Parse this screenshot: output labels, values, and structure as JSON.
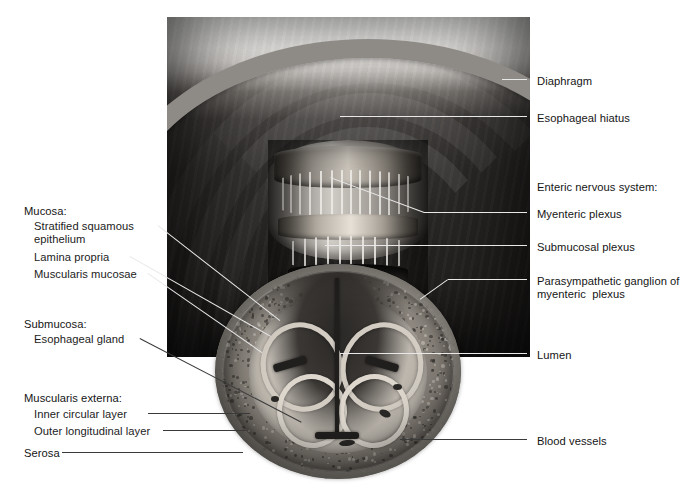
{
  "figure": {
    "background_color": "#ffffff",
    "plate_color": "#2d2b29"
  },
  "labels_left": [
    {
      "id": "mucosa-group",
      "text": "Mucosa:",
      "x": 24,
      "y": 205,
      "indent": false,
      "leader": false
    },
    {
      "id": "stratified-squamous",
      "text": "Stratified squamous",
      "x": 34,
      "y": 220,
      "indent": true,
      "leader": true
    },
    {
      "id": "epithelium",
      "text": "epithelium",
      "x": 34,
      "y": 233,
      "indent": true,
      "leader": false
    },
    {
      "id": "lamina-propria",
      "text": "Lamina propria",
      "x": 34,
      "y": 251,
      "indent": true,
      "leader": true
    },
    {
      "id": "muscularis-mucosae",
      "text": "Muscularis mucosae",
      "x": 34,
      "y": 268,
      "indent": true,
      "leader": true
    },
    {
      "id": "submucosa-group",
      "text": "Submucosa:",
      "x": 24,
      "y": 318,
      "indent": false,
      "leader": false
    },
    {
      "id": "esophageal-gland",
      "text": "Esophageal gland",
      "x": 34,
      "y": 333,
      "indent": true,
      "leader": true
    },
    {
      "id": "muscularis-externa-group",
      "text": "Muscularis externa:",
      "x": 24,
      "y": 392,
      "indent": false,
      "leader": false
    },
    {
      "id": "inner-circular-layer",
      "text": "Inner circular layer",
      "x": 34,
      "y": 408,
      "indent": true,
      "leader": true
    },
    {
      "id": "outer-longitudinal-layer",
      "text": "Outer longitudinal layer",
      "x": 34,
      "y": 425,
      "indent": true,
      "leader": true
    },
    {
      "id": "serosa",
      "text": "Serosa",
      "x": 24,
      "y": 447,
      "indent": false,
      "leader": true
    }
  ],
  "labels_right": [
    {
      "id": "diaphragm",
      "text": "Diaphragm",
      "x": 537,
      "y": 75,
      "leader": true
    },
    {
      "id": "esophageal-hiatus",
      "text": "Esophageal hiatus",
      "x": 537,
      "y": 112,
      "leader": true
    },
    {
      "id": "enteric-nervous-system-group",
      "text": "Enteric nervous system:",
      "x": 537,
      "y": 181,
      "leader": false
    },
    {
      "id": "myenteric-plexus",
      "text": "Myenteric plexus",
      "x": 537,
      "y": 208,
      "leader": true
    },
    {
      "id": "submucosal-plexus",
      "text": "Submucosal plexus",
      "x": 537,
      "y": 241,
      "leader": true
    },
    {
      "id": "parasympathetic-ganglion",
      "text": "Parasympathetic ganglion of",
      "x": 537,
      "y": 275,
      "leader": true
    },
    {
      "id": "parasympathetic-ganglion-line2",
      "text": "myenteric  plexus",
      "x": 537,
      "y": 288,
      "leader": false
    },
    {
      "id": "lumen",
      "text": "Lumen",
      "x": 537,
      "y": 349,
      "leader": true
    },
    {
      "id": "blood-vessels",
      "text": "Blood vessels",
      "x": 537,
      "y": 435,
      "leader": true
    }
  ],
  "leaders_left": [
    {
      "id": "leader-stratified-squamous",
      "x1": 158,
      "y1": 225,
      "x2": 280,
      "y2": 320
    },
    {
      "id": "leader-lamina-propria",
      "x1": 130,
      "y1": 256,
      "x2": 271,
      "y2": 336
    },
    {
      "id": "leader-muscularis-mucosae",
      "x1": 148,
      "y1": 273,
      "x2": 262,
      "y2": 352
    },
    {
      "id": "leader-esophageal-gland",
      "x1": 140,
      "y1": 338,
      "x2": 302,
      "y2": 422
    },
    {
      "id": "leader-inner-circular",
      "x1": 148,
      "y1": 413,
      "x2": 250,
      "y2": 413
    },
    {
      "id": "leader-outer-longitudinal",
      "x1": 163,
      "y1": 430,
      "x2": 246,
      "y2": 430
    },
    {
      "id": "leader-serosa",
      "x1": 62,
      "y1": 452,
      "x2": 243,
      "y2": 452
    }
  ],
  "leaders_right": [
    {
      "id": "leader-diaphragm",
      "x1": 527,
      "y1": 80,
      "x2": 502,
      "y2": 80
    },
    {
      "id": "leader-esophageal-hiatus",
      "x1": 527,
      "y1": 117,
      "x2": 340,
      "y2": 117
    },
    {
      "id": "leader-myenteric-plexus",
      "x1": 527,
      "y1": 213,
      "x2": 424,
      "y2": 213
    },
    {
      "id": "leader-myenteric-diag",
      "x1": 424,
      "y1": 213,
      "x2": 330,
      "y2": 178
    },
    {
      "id": "leader-submucosal-plexus",
      "x1": 527,
      "y1": 246,
      "x2": 325,
      "y2": 246
    },
    {
      "id": "leader-parasympathetic",
      "x1": 527,
      "y1": 280,
      "x2": 448,
      "y2": 280
    },
    {
      "id": "leader-parasympathetic-d",
      "x1": 448,
      "y1": 280,
      "x2": 420,
      "y2": 300
    },
    {
      "id": "leader-lumen",
      "x1": 527,
      "y1": 354,
      "x2": 340,
      "y2": 354
    },
    {
      "id": "leader-blood-vessels",
      "x1": 527,
      "y1": 440,
      "x2": 400,
      "y2": 440
    }
  ],
  "illustration": {
    "plate": {
      "x": 167,
      "y": 17,
      "width": 363,
      "height": 340
    },
    "cross_section": {
      "x": 215,
      "y": 264,
      "width": 246,
      "height": 215
    },
    "tube": {
      "x": 268,
      "y": 140,
      "width": 160,
      "height": 180
    }
  }
}
